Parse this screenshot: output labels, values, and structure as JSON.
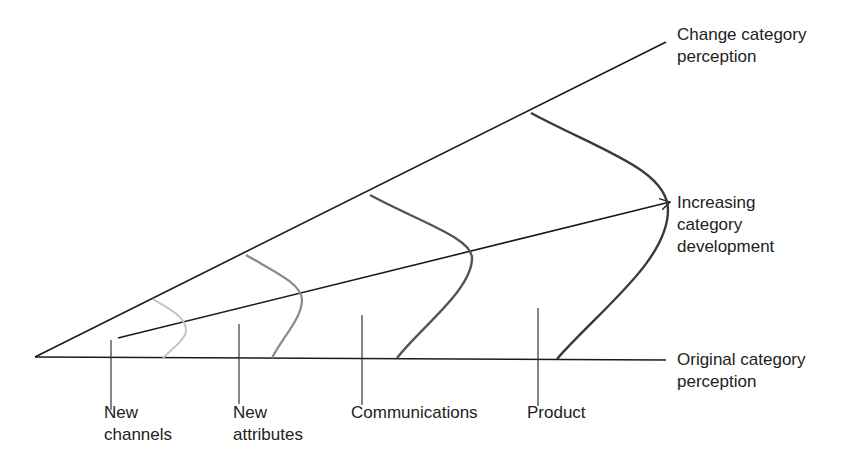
{
  "diagram": {
    "right_labels": {
      "change": [
        "Change category",
        "perception"
      ],
      "increasing": [
        "Increasing",
        "category",
        "development"
      ],
      "original": [
        "Original category",
        "perception"
      ]
    },
    "bottom_labels": [
      {
        "lines": [
          "New",
          "channels"
        ]
      },
      {
        "lines": [
          "New",
          "attributes"
        ]
      },
      {
        "lines": [
          "Communications"
        ]
      },
      {
        "lines": [
          "Product"
        ]
      }
    ],
    "curve_colors": [
      "#c4c4c4",
      "#8a8a8a",
      "#555555",
      "#3a3a3a"
    ],
    "line_color": "#1a1a1a"
  }
}
